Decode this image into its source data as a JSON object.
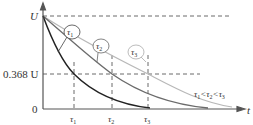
{
  "diagram": {
    "title": "",
    "type": "exponential-decay",
    "axes": {
      "y_top_label": "U",
      "y_mid_label": "0.368 U",
      "origin_label": "0",
      "x_label": "t"
    },
    "ticks": {
      "tau1": "τ",
      "tau1_sub": "1",
      "tau2": "τ",
      "tau2_sub": "2",
      "tau3": "τ",
      "tau3_sub": "3"
    },
    "callouts": [
      {
        "symbol": "τ",
        "sub": "1"
      },
      {
        "symbol": "τ",
        "sub": "2"
      },
      {
        "symbol": "τ",
        "sub": "3"
      }
    ],
    "relation": {
      "t1": "τ",
      "s1": "1",
      "lt1": "<",
      "t2": "τ",
      "s2": "2",
      "lt2": "<",
      "t3": "τ",
      "s3": "3"
    },
    "colors": {
      "axis": "#555555",
      "curve1": "#222222",
      "curve2": "#6b6b6b",
      "curve3": "#b8b8b8",
      "dash": "#444444"
    }
  }
}
